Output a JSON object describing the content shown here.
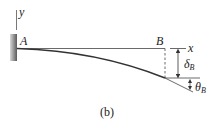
{
  "figure": {
    "caption": "(b)",
    "labels": {
      "y_axis": "y",
      "x_axis": "x",
      "point_a": "A",
      "point_b": "B",
      "delta": "δ",
      "delta_sub": "B",
      "theta": "θ",
      "theta_sub": "B"
    },
    "colors": {
      "line": "#333333",
      "wall": "#777777",
      "background": "#ffffff"
    }
  }
}
